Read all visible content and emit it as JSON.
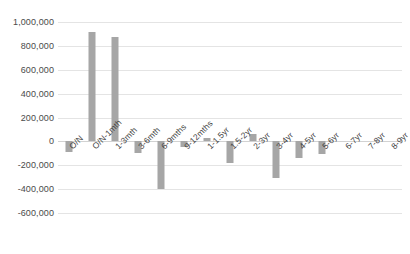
{
  "chart_data": {
    "type": "bar",
    "title": "",
    "xlabel": "",
    "ylabel": "",
    "ylim": [
      -600000,
      1000000
    ],
    "ytick_step": 200000,
    "grid": true,
    "legend": false,
    "bar_color": "#a6a6a6",
    "gridline_color": "#e4e4e4",
    "yticks": [
      "1,000,000",
      "800,000",
      "600,000",
      "400,000",
      "200,000",
      "0",
      "-200,000",
      "-400,000",
      "-600,000"
    ],
    "ytick_values": [
      1000000,
      800000,
      600000,
      400000,
      200000,
      0,
      -200000,
      -400000,
      -600000
    ],
    "categories": [
      "O/N",
      "O/N-1mth",
      "1-3mth",
      "3-6mth",
      "6-9mths",
      "9-12mths",
      "1-1.5yr",
      "1.5-2yr",
      "2-3yr",
      "3-4yr",
      "4-5yr",
      "5-6yr",
      "6-7yr",
      "7-8yr",
      "8-9yr"
    ],
    "values": [
      -90000,
      920000,
      875000,
      -100000,
      -395000,
      -45000,
      25000,
      -185000,
      65000,
      -310000,
      -140000,
      -105000,
      0,
      0,
      0
    ]
  }
}
